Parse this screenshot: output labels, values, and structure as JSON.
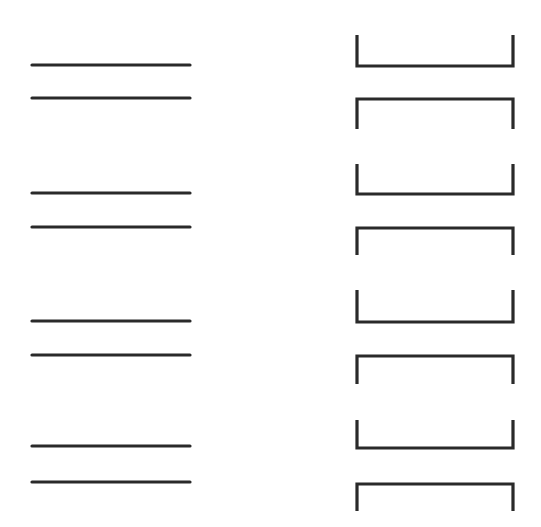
{
  "diagram": {
    "stroke_color": "#2a2a2a",
    "stroke_width": 3.2,
    "background": "#ffffff",
    "left_column": {
      "description": "pairs of plain horizontal lines",
      "x1": 32,
      "x2": 190,
      "lines_y": [
        65,
        98,
        193,
        227,
        321,
        355,
        446,
        482
      ]
    },
    "right_column": {
      "description": "pairs of bracket shapes: open-top (U) above open-bottom (inverted U)",
      "x1": 357,
      "x2": 513,
      "brackets": [
        {
          "type": "open-top",
          "bar_y": 66,
          "end_y": 35
        },
        {
          "type": "open-bottom",
          "bar_y": 99,
          "end_y": 129
        },
        {
          "type": "open-top",
          "bar_y": 194,
          "end_y": 164
        },
        {
          "type": "open-bottom",
          "bar_y": 228,
          "end_y": 255
        },
        {
          "type": "open-top",
          "bar_y": 322,
          "end_y": 290
        },
        {
          "type": "open-bottom",
          "bar_y": 356,
          "end_y": 384
        },
        {
          "type": "open-top",
          "bar_y": 448,
          "end_y": 420
        },
        {
          "type": "open-bottom",
          "bar_y": 484,
          "end_y": 511
        }
      ]
    }
  }
}
